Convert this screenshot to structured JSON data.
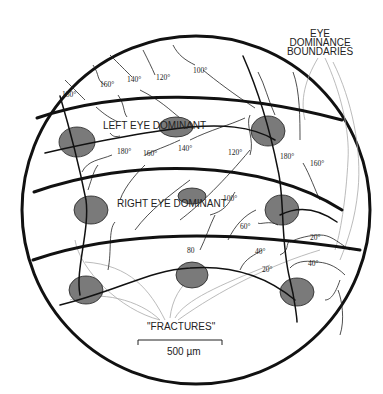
{
  "labels": {
    "eye_dominance_boundaries": [
      "EYE",
      "DOMINANCE",
      "BOUNDARIES"
    ],
    "left_eye_dominant": "LEFT EYE DOMINANT",
    "right_eye_dominant": "RIGHT EYE DOMINANT",
    "fractures": "\"FRACTURES\"",
    "scale_bar": "500 µm"
  },
  "orientation_labels": {
    "top_row": [
      "180°",
      "160°",
      "140°",
      "120°",
      "100°"
    ],
    "middle_row": [
      "180°",
      "160°",
      "140°",
      "120°",
      "180°",
      "160°"
    ],
    "lower_row": [
      "100°",
      "60°",
      "80",
      "40°",
      "20°",
      "20°",
      "40°"
    ]
  },
  "colors": {
    "outline": "#111111",
    "fracture_blob": "#7a7a7a",
    "boundary_guide": "#aaaaaa"
  }
}
